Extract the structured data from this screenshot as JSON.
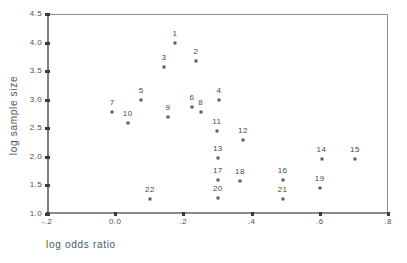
{
  "chart_data": {
    "type": "scatter",
    "title": "",
    "xlabel": "log odds ratio",
    "ylabel": "log sample size",
    "xlim": [
      -0.2,
      0.8
    ],
    "ylim": [
      1.0,
      4.5
    ],
    "grid": false,
    "legend": "none",
    "xticks": [
      -0.2,
      0.0,
      0.2,
      0.4,
      0.6,
      0.8
    ],
    "xticklabels": [
      "-.2",
      "0.0",
      ".2",
      ".4",
      ".6",
      ".8"
    ],
    "yticks": [
      1.0,
      1.5,
      2.0,
      2.5,
      3.0,
      3.5,
      4.0,
      4.5
    ],
    "yticklabels": [
      "1.0",
      "1.5",
      "2.0",
      "2.5",
      "3.0",
      "3.5",
      "4.0",
      "4.5"
    ],
    "marker": "small-square",
    "point_label_position": "above",
    "points": [
      {
        "label": "1",
        "x": 0.175,
        "y": 3.99
      },
      {
        "label": "2",
        "x": 0.237,
        "y": 3.68
      },
      {
        "label": "3",
        "x": 0.143,
        "y": 3.58
      },
      {
        "label": "4",
        "x": 0.304,
        "y": 2.99
      },
      {
        "label": "5",
        "x": 0.076,
        "y": 2.99
      },
      {
        "label": "6",
        "x": 0.225,
        "y": 2.88
      },
      {
        "label": "7",
        "x": -0.009,
        "y": 2.78
      },
      {
        "label": "8",
        "x": 0.251,
        "y": 2.78
      },
      {
        "label": "9",
        "x": 0.155,
        "y": 2.7
      },
      {
        "label": "10",
        "x": 0.037,
        "y": 2.59
      },
      {
        "label": "11",
        "x": 0.298,
        "y": 2.45
      },
      {
        "label": "12",
        "x": 0.375,
        "y": 2.3
      },
      {
        "label": "13",
        "x": 0.301,
        "y": 1.98
      },
      {
        "label": "14",
        "x": 0.605,
        "y": 1.97
      },
      {
        "label": "15",
        "x": 0.703,
        "y": 1.97
      },
      {
        "label": "16",
        "x": 0.491,
        "y": 1.6
      },
      {
        "label": "17",
        "x": 0.301,
        "y": 1.6
      },
      {
        "label": "18",
        "x": 0.366,
        "y": 1.58
      },
      {
        "label": "19",
        "x": 0.6,
        "y": 1.45
      },
      {
        "label": "20",
        "x": 0.301,
        "y": 1.28
      },
      {
        "label": "21",
        "x": 0.491,
        "y": 1.27
      },
      {
        "label": "22",
        "x": 0.102,
        "y": 1.27
      }
    ]
  },
  "colors": {
    "marker": "#5c5c5c",
    "axis": "#7d7d7d",
    "text": "#4a4a4a",
    "background": "#ffffff"
  }
}
